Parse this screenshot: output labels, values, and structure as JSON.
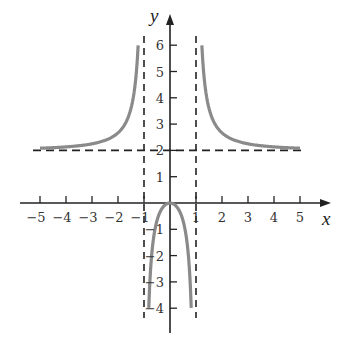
{
  "chart_data": {
    "type": "line",
    "title": "",
    "function": "y = 2x^2 / (x^2 - 1)",
    "xlabel": "x",
    "ylabel": "y",
    "xlim": [
      -5.5,
      6
    ],
    "ylim": [
      -4.7,
      6.7
    ],
    "grid": false,
    "legend": null,
    "x_ticks": [
      -5,
      -4,
      -3,
      -2,
      -1,
      1,
      2,
      3,
      4,
      5
    ],
    "y_ticks": [
      -4,
      -3,
      -2,
      -1,
      1,
      2,
      3,
      4,
      5,
      6
    ],
    "x_tick_labels": [
      "−5",
      "−4",
      "−3",
      "−2",
      "−1",
      "1",
      "2",
      "3",
      "4",
      "5"
    ],
    "y_tick_labels": [
      "−4",
      "−3",
      "−2",
      "−1",
      "1",
      "2",
      "3",
      "4",
      "5",
      "6"
    ],
    "asymptotes": {
      "vertical": [
        -1,
        1
      ],
      "horizontal": [
        2
      ]
    },
    "series": [
      {
        "name": "left branch",
        "x": [
          -5,
          -4,
          -3,
          -2,
          -1.5,
          -1.3,
          -1.225
        ],
        "y": [
          2.083,
          2.133,
          2.25,
          2.667,
          3.6,
          4.87,
          6
        ]
      },
      {
        "name": "middle branch",
        "x": [
          -0.816,
          -0.7,
          -0.5,
          -0.3,
          0,
          0.3,
          0.5,
          0.7,
          0.816
        ],
        "y": [
          -4,
          -1.922,
          -0.667,
          -0.198,
          0,
          -0.198,
          -0.667,
          -1.922,
          -4
        ]
      },
      {
        "name": "right branch",
        "x": [
          1.225,
          1.3,
          1.5,
          2,
          3,
          4,
          5
        ],
        "y": [
          6,
          4.87,
          3.6,
          2.667,
          2.25,
          2.133,
          2.083
        ]
      }
    ],
    "colors": {
      "curve": "#8a8a8a",
      "axes": "#222222",
      "asymptote": "#222222"
    }
  },
  "labels": {
    "x_axis": "x",
    "y_axis": "y"
  }
}
